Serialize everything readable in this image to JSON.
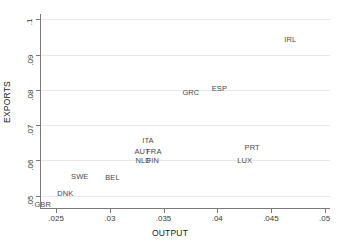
{
  "chart_data": {
    "type": "scatter",
    "title": "",
    "xlabel": "OUTPUT",
    "ylabel": "EXPORTS",
    "xlim": [
      0.0235,
      0.0505
    ],
    "ylim": [
      0.0465,
      0.1015
    ],
    "xticks": [
      ".025",
      ".03",
      ".035",
      ".04",
      ".045",
      ".05"
    ],
    "xtick_values": [
      0.025,
      0.03,
      0.035,
      0.04,
      0.045,
      0.05
    ],
    "yticks": [
      ".05",
      ".06",
      ".07",
      ".08",
      ".09",
      ".1"
    ],
    "ytick_values": [
      0.05,
      0.06,
      0.07,
      0.08,
      0.09,
      0.1
    ],
    "grid": "horizontal",
    "legend": "none",
    "marker_style": "text-label",
    "points": [
      {
        "label": "GBR",
        "x": 0.02375,
        "y": 0.0477
      },
      {
        "label": "DNK",
        "x": 0.02585,
        "y": 0.0507
      },
      {
        "label": "SWE",
        "x": 0.0272,
        "y": 0.0556
      },
      {
        "label": "BEL",
        "x": 0.03025,
        "y": 0.0554
      },
      {
        "label": "NLD",
        "x": 0.0331,
        "y": 0.0601
      },
      {
        "label": "FIN",
        "x": 0.034,
        "y": 0.0601
      },
      {
        "label": "AUT",
        "x": 0.033,
        "y": 0.0626
      },
      {
        "label": "FRA",
        "x": 0.0341,
        "y": 0.0626
      },
      {
        "label": "ITA",
        "x": 0.03355,
        "y": 0.0657
      },
      {
        "label": "GRC",
        "x": 0.03755,
        "y": 0.0794
      },
      {
        "label": "ESP",
        "x": 0.0402,
        "y": 0.0806
      },
      {
        "label": "LUX",
        "x": 0.04255,
        "y": 0.06
      },
      {
        "label": "PRT",
        "x": 0.04325,
        "y": 0.0639
      },
      {
        "label": "IRL",
        "x": 0.0468,
        "y": 0.0945
      }
    ]
  },
  "colors": {
    "background": "#ffffff",
    "axis": "#7a7a7a",
    "gridline": "#e8e8e8",
    "tick_label": "#3a3a3a",
    "axis_title": "#1a1a1a",
    "point_label": "#4a4a4a"
  }
}
